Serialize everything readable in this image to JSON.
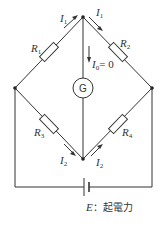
{
  "diagram": {
    "type": "wheatstone-bridge",
    "resistors": [
      {
        "id": "R1",
        "label": "R",
        "sub": "1"
      },
      {
        "id": "R2",
        "label": "R",
        "sub": "2"
      },
      {
        "id": "R3",
        "label": "R",
        "sub": "3"
      },
      {
        "id": "R4",
        "label": "R",
        "sub": "4"
      }
    ],
    "galvanometer": {
      "label": "G"
    },
    "currents": {
      "i1_left": {
        "label": "I",
        "sub": "1"
      },
      "i1_right": {
        "label": "I",
        "sub": "1"
      },
      "i0": {
        "label": "I",
        "sub": "0",
        "value": "= 0"
      },
      "i2_left": {
        "label": "I",
        "sub": "2"
      },
      "i2_right": {
        "label": "I",
        "sub": "2"
      }
    },
    "battery": {
      "label": "E",
      "caption": "：起電力"
    }
  }
}
